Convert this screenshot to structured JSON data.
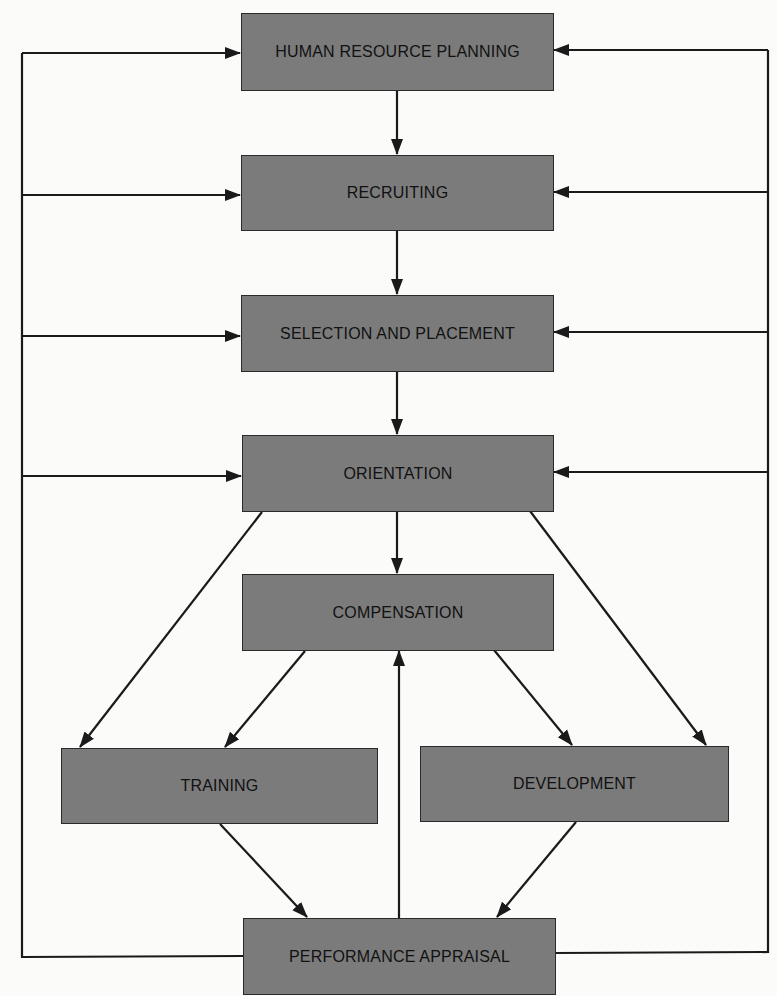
{
  "diagram": {
    "type": "flowchart",
    "nodes": [
      {
        "id": "hrp",
        "label": "HUMAN RESOURCE PLANNING"
      },
      {
        "id": "recruiting",
        "label": "RECRUITING"
      },
      {
        "id": "selection",
        "label": "SELECTION AND PLACEMENT"
      },
      {
        "id": "orientation",
        "label": "ORIENTATION"
      },
      {
        "id": "compensation",
        "label": "COMPENSATION"
      },
      {
        "id": "training",
        "label": "TRAINING"
      },
      {
        "id": "development",
        "label": "DEVELOPMENT"
      },
      {
        "id": "appraisal",
        "label": "PERFORMANCE APPRAISAL"
      }
    ],
    "edges": [
      {
        "from": "hrp",
        "to": "recruiting"
      },
      {
        "from": "recruiting",
        "to": "selection"
      },
      {
        "from": "selection",
        "to": "orientation"
      },
      {
        "from": "orientation",
        "to": "compensation"
      },
      {
        "from": "orientation",
        "to": "training"
      },
      {
        "from": "orientation",
        "to": "development"
      },
      {
        "from": "compensation",
        "to": "training"
      },
      {
        "from": "compensation",
        "to": "development"
      },
      {
        "from": "training",
        "to": "appraisal"
      },
      {
        "from": "development",
        "to": "appraisal"
      },
      {
        "from": "appraisal",
        "to": "compensation"
      },
      {
        "from": "appraisal",
        "to": "hrp",
        "via": "left-feedback-bus"
      },
      {
        "from": "appraisal",
        "to": "recruiting",
        "via": "left-feedback-bus"
      },
      {
        "from": "appraisal",
        "to": "selection",
        "via": "left-feedback-bus"
      },
      {
        "from": "appraisal",
        "to": "orientation",
        "via": "left-feedback-bus"
      },
      {
        "from": "appraisal",
        "to": "hrp",
        "via": "right-feedback-bus"
      },
      {
        "from": "appraisal",
        "to": "recruiting",
        "via": "right-feedback-bus"
      },
      {
        "from": "appraisal",
        "to": "selection",
        "via": "right-feedback-bus"
      },
      {
        "from": "appraisal",
        "to": "orientation",
        "via": "right-feedback-bus"
      }
    ],
    "colors": {
      "box_fill": "#7b7b7b",
      "line": "#1a1a1a",
      "background": "#fbfbf9"
    }
  }
}
